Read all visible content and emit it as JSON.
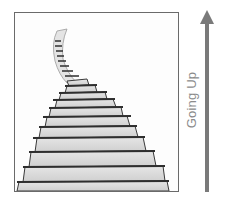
{
  "illustration": {
    "description": "hand-drawn staircase rising into the distance",
    "step_count": 16,
    "colors": {
      "frame": "#6a6a6a",
      "step_fill": "#d9d9d9",
      "step_edge": "#3a3a3a"
    }
  },
  "arrow": {
    "direction": "up",
    "color": "#7a7a7a",
    "label": "Going Up"
  }
}
